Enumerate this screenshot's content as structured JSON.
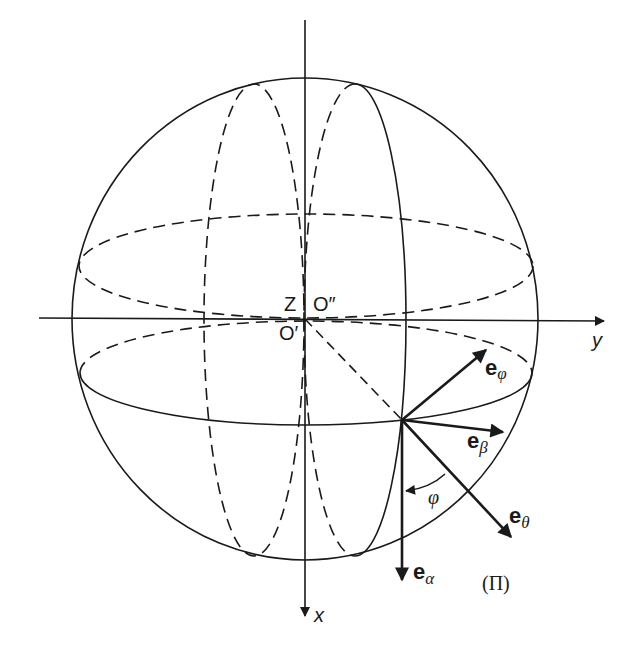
{
  "figure": {
    "type": "sphere-coordinate-diagram",
    "colors": {
      "line": "#1a1a1a",
      "background": "#ffffff"
    }
  },
  "axes": {
    "x_label": "x",
    "y_label": "y"
  },
  "points": {
    "z_label": "Z",
    "origin_prime": "O′",
    "origin_double_prime": "O″"
  },
  "vectors": {
    "e_phi": {
      "base": "e",
      "sub": "φ"
    },
    "e_beta": {
      "base": "e",
      "sub": "β"
    },
    "e_theta": {
      "base": "e",
      "sub": "θ"
    },
    "e_alpha": {
      "base": "e",
      "sub": "α"
    }
  },
  "angle": {
    "label": "φ"
  },
  "plane": {
    "label": "(Π)"
  }
}
